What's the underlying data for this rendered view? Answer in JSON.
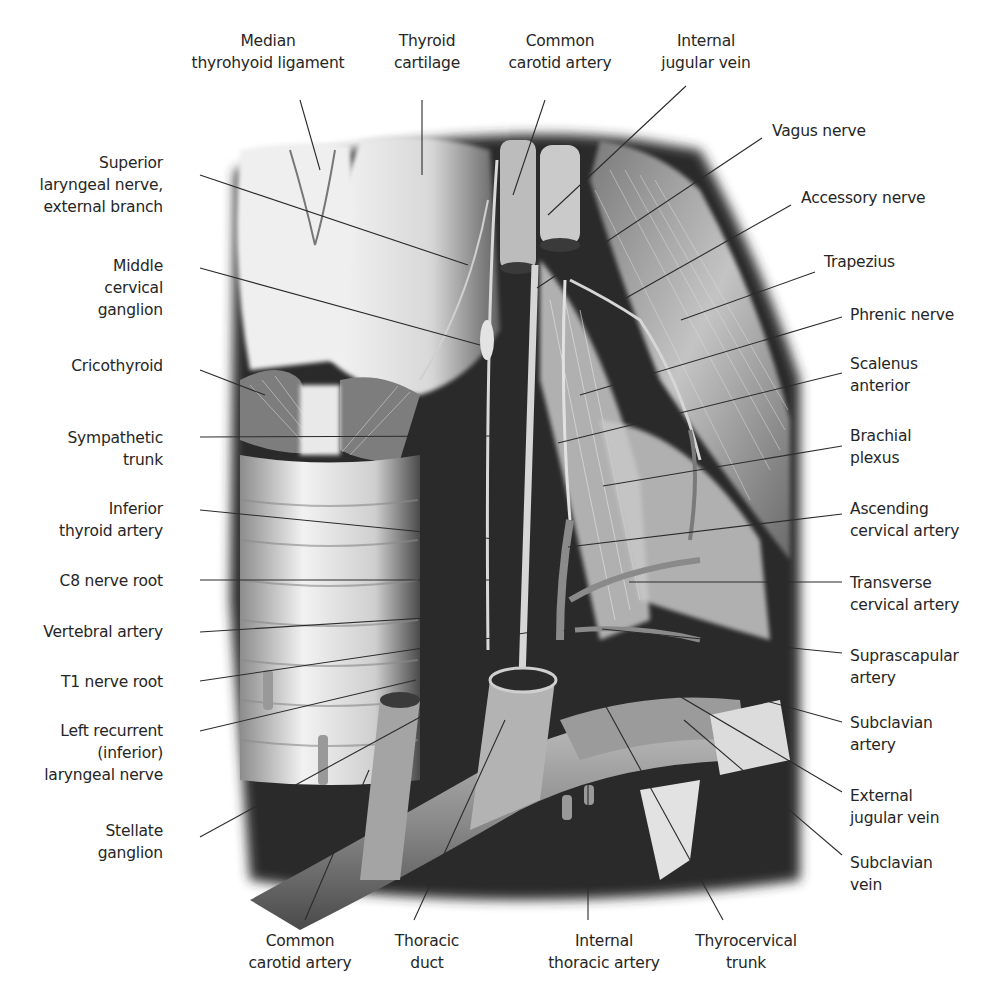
{
  "figure": {
    "top_labels": [
      {
        "id": "median-thyrohyoid-ligament",
        "text": "Median\nthyrohyoid ligament",
        "x": 268,
        "y": 30
      },
      {
        "id": "thyroid-cartilage",
        "text": "Thyroid\ncartilage",
        "x": 427,
        "y": 30
      },
      {
        "id": "common-carotid-artery-top",
        "text": "Common\ncarotid artery",
        "x": 560,
        "y": 30
      },
      {
        "id": "internal-jugular-vein",
        "text": "Internal\njugular vein",
        "x": 706,
        "y": 30
      }
    ],
    "left_labels": [
      {
        "id": "superior-laryngeal-nerve",
        "text": "Superior\nlaryngeal nerve,\nexternal branch",
        "y": 152
      },
      {
        "id": "middle-cervical-ganglion",
        "text": "Middle\ncervical\nganglion",
        "y": 255
      },
      {
        "id": "cricothyroid",
        "text": "Cricothyroid",
        "y": 355
      },
      {
        "id": "sympathetic-trunk",
        "text": "Sympathetic\ntrunk",
        "y": 427
      },
      {
        "id": "inferior-thyroid-artery",
        "text": "Inferior\nthyroid artery",
        "y": 498
      },
      {
        "id": "c8-nerve-root",
        "text": "C8 nerve root",
        "y": 570
      },
      {
        "id": "vertebral-artery",
        "text": "Vertebral artery",
        "y": 621
      },
      {
        "id": "t1-nerve-root",
        "text": "T1 nerve root",
        "y": 671
      },
      {
        "id": "left-recurrent-laryngeal-nerve",
        "text": "Left recurrent\n(inferior)\nlaryngeal nerve",
        "y": 720
      },
      {
        "id": "stellate-ganglion",
        "text": "Stellate\nganglion",
        "y": 820
      }
    ],
    "right_labels": [
      {
        "id": "vagus-nerve",
        "text": "Vagus nerve",
        "x": 772,
        "y": 120
      },
      {
        "id": "accessory-nerve",
        "text": "Accessory nerve",
        "x": 801,
        "y": 187
      },
      {
        "id": "trapezius",
        "text": "Trapezius",
        "x": 824,
        "y": 251
      },
      {
        "id": "phrenic-nerve",
        "text": "Phrenic nerve",
        "x": 850,
        "y": 304
      },
      {
        "id": "scalenus-anterior",
        "text": "Scalenus\nanterior",
        "x": 850,
        "y": 353
      },
      {
        "id": "brachial-plexus",
        "text": "Brachial\nplexus",
        "x": 850,
        "y": 425
      },
      {
        "id": "ascending-cervical-artery",
        "text": "Ascending\ncervical artery",
        "x": 850,
        "y": 498
      },
      {
        "id": "transverse-cervical-artery",
        "text": "Transverse\ncervical artery",
        "x": 850,
        "y": 572
      },
      {
        "id": "suprascapular-artery",
        "text": "Suprascapular\nartery",
        "x": 850,
        "y": 645
      },
      {
        "id": "subclavian-artery",
        "text": "Subclavian\nartery",
        "x": 850,
        "y": 712
      },
      {
        "id": "external-jugular-vein",
        "text": "External\njugular vein",
        "x": 850,
        "y": 785
      },
      {
        "id": "subclavian-vein",
        "text": "Subclavian\nvein",
        "x": 850,
        "y": 852
      }
    ],
    "bottom_labels": [
      {
        "id": "common-carotid-artery-bottom",
        "text": "Common\ncarotid artery",
        "x": 300,
        "y": 930
      },
      {
        "id": "thoracic-duct",
        "text": "Thoracic\nduct",
        "x": 427,
        "y": 930
      },
      {
        "id": "internal-thoracic-artery",
        "text": "Internal\nthoracic artery",
        "x": 604,
        "y": 930
      },
      {
        "id": "thyrocervical-trunk",
        "text": "Thyrocervical\ntrunk",
        "x": 746,
        "y": 930
      }
    ],
    "colors": {
      "background": "#ffffff",
      "leader_line": "#2b2b2b",
      "text": "#262626",
      "tissue_light": "#e9e9e9",
      "tissue_mid": "#9a9a9a",
      "tissue_dark": "#1a1a1a"
    }
  }
}
